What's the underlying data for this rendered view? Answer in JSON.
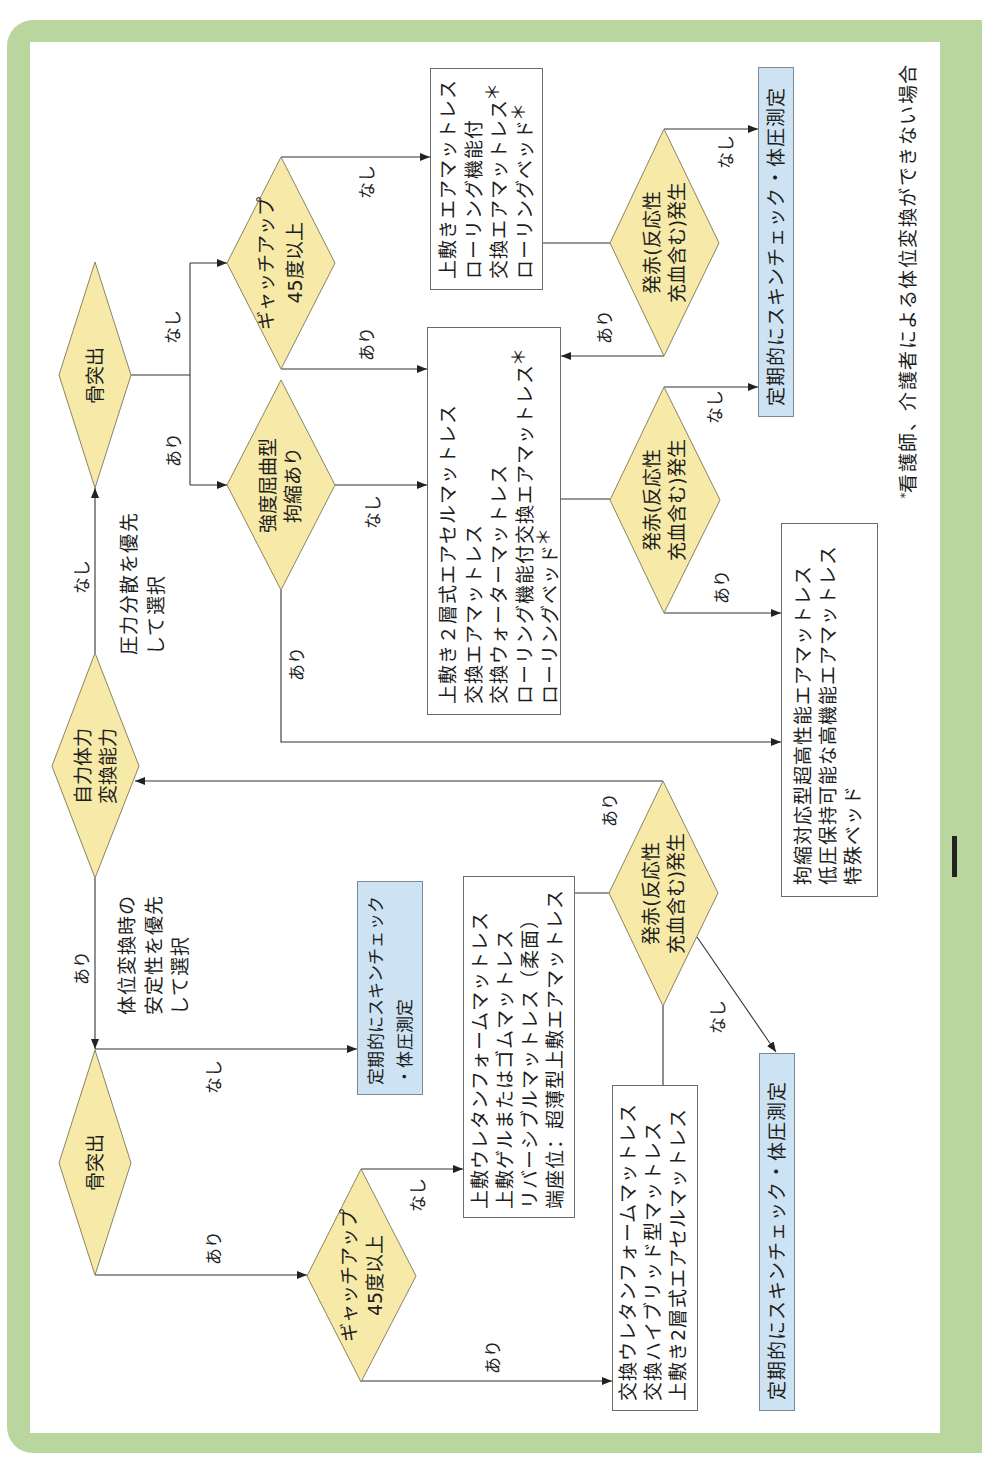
{
  "figure": {
    "type": "flowchart",
    "orientation": "rotated 90deg counter-clockwise",
    "colors": {
      "frame": "#b9d69e",
      "decision_fill": "#f7eaa8",
      "decision_border": "#8a8464",
      "action_fill": "#cde2f3",
      "box_border": "#6a6a6a",
      "line": "#333333"
    },
    "footnote": {
      "mark": "*",
      "text": "看護師、介護者による体位変換ができない場合"
    }
  },
  "decisions": {
    "mobility": {
      "lines": [
        "自力体力",
        "変換能力"
      ]
    },
    "bony_upper": {
      "lines": [
        "骨突出"
      ]
    },
    "gatch_upper": {
      "lines": [
        "ギャッチアップ",
        "45度以上"
      ]
    },
    "contracture": {
      "lines": [
        "強度屈曲型",
        "拘縮あり"
      ]
    },
    "redness_a": {
      "lines": [
        "発赤(反応性",
        "充血含む)発生"
      ]
    },
    "redness_b": {
      "lines": [
        "発赤(反応性",
        "充血含む)発生"
      ]
    },
    "redness_c": {
      "lines": [
        "発赤(反応性",
        "充血含む)発生"
      ]
    },
    "bony_lower": {
      "lines": [
        "骨突出"
      ]
    },
    "gatch_lower": {
      "lines": [
        "ギャッチアップ",
        "45度以上"
      ]
    }
  },
  "notes": {
    "pressure_priority": {
      "lines": [
        "圧力分散を優先",
        "して選択"
      ]
    },
    "stability_priority": {
      "lines": [
        "体位変換時の",
        "安定性を優先",
        "して選択"
      ]
    }
  },
  "mattress_boxes": {
    "air_rolling": {
      "lines": [
        {
          "text": "上敷きエアマットレス"
        },
        {
          "text": "ローリング機能付"
        },
        {
          "text": "交換エアマットレス",
          "mark": "＊"
        },
        {
          "text": "ローリングベッド",
          "mark": "＊"
        }
      ]
    },
    "air_cell": {
      "lines": [
        {
          "text": "上敷き２層式エアセルマットレス"
        },
        {
          "text": "交換エアマットレス"
        },
        {
          "text": "交換ウォーターマットレス"
        },
        {
          "text": "ローリング機能付交換エアマットレス",
          "mark": "＊"
        },
        {
          "text": "ローリングベッド",
          "mark": "＊"
        }
      ]
    },
    "contracture_special": {
      "lines": [
        {
          "text": "拘縮対応型超高性能エアマットレス"
        },
        {
          "text": "低圧保持可能な高機能エアマットレス"
        },
        {
          "text": "特殊ベッド"
        }
      ]
    },
    "topper": {
      "lines": [
        {
          "text": "上敷ウレタンフォームマットレス"
        },
        {
          "text": "上敷ゲルまたはゴムマットレス"
        },
        {
          "text": "リバーシブルマットレス（柔面）"
        },
        {
          "text": "端座位：超薄型上敷エアマットレス"
        }
      ]
    },
    "replacement": {
      "lines": [
        {
          "text": "交換ウレタンフォームマットレス"
        },
        {
          "text": "交換ハイブリッド型マットレス"
        },
        {
          "text": "上敷き2層式エアセルマットレス"
        }
      ]
    }
  },
  "action_boxes": {
    "check_upper": {
      "lines": [
        "定期的にスキンチェック・体圧測定"
      ]
    },
    "check_middle": {
      "lines": [
        "定期的にスキンチェック",
        "・体圧測定"
      ]
    },
    "check_lower": {
      "lines": [
        "定期的にスキンチェック・体圧測定"
      ]
    }
  },
  "edges": [
    {
      "from": "mobility",
      "to": "bony_upper",
      "label": "なし"
    },
    {
      "from": "mobility",
      "to": "bony_lower",
      "label": "あり"
    },
    {
      "from": "bony_upper",
      "to": "gatch_upper",
      "label": "なし"
    },
    {
      "from": "bony_upper",
      "to": "contracture",
      "label": "あり"
    },
    {
      "from": "gatch_upper",
      "to": "air_rolling",
      "label": "なし"
    },
    {
      "from": "gatch_upper",
      "to": "air_cell",
      "label": "あり"
    },
    {
      "from": "contracture",
      "to": "air_cell",
      "label": "なし"
    },
    {
      "from": "contracture",
      "to": "contracture_special",
      "label": "あり"
    },
    {
      "from": "air_rolling",
      "to": "redness_a",
      "label": ""
    },
    {
      "from": "redness_a",
      "to": "check_upper",
      "label": "なし"
    },
    {
      "from": "redness_a",
      "to": "air_cell",
      "label": "あり"
    },
    {
      "from": "air_cell",
      "to": "redness_b",
      "label": ""
    },
    {
      "from": "redness_b",
      "to": "check_upper",
      "label": "なし"
    },
    {
      "from": "redness_b",
      "to": "contracture_special",
      "label": "あり"
    },
    {
      "from": "redness_c",
      "to": "mobility",
      "label": "あり"
    },
    {
      "from": "topper",
      "to": "redness_c",
      "label": ""
    },
    {
      "from": "replacement",
      "to": "redness_c",
      "label": ""
    },
    {
      "from": "redness_c",
      "to": "check_lower",
      "label": "なし"
    },
    {
      "from": "bony_lower",
      "to": "check_middle",
      "label": "なし"
    },
    {
      "from": "bony_lower",
      "to": "gatch_lower",
      "label": "あり"
    },
    {
      "from": "gatch_lower",
      "to": "topper",
      "label": "なし"
    },
    {
      "from": "gatch_lower",
      "to": "replacement",
      "label": "あり"
    }
  ]
}
